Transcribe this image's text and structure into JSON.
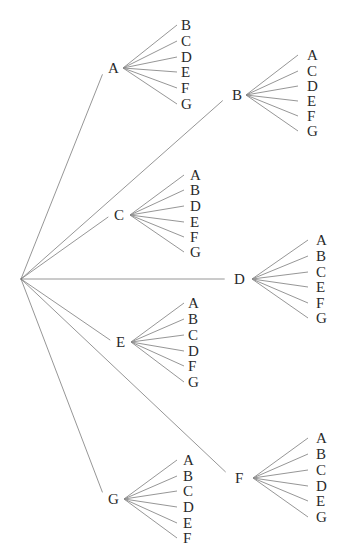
{
  "diagram": {
    "type": "tree",
    "clipped_header_text": "",
    "root": {
      "x": 21,
      "y": 279
    },
    "line_color": "#8a8a8a",
    "text_color": "#2a2a2a",
    "branches": [
      {
        "label": "A",
        "label_x": 108,
        "node_x": 123,
        "y": 68,
        "child_line_x": 177,
        "child_label_x": 181,
        "children": [
          {
            "label": "B",
            "y": 25
          },
          {
            "label": "C",
            "y": 41
          },
          {
            "label": "D",
            "y": 57
          },
          {
            "label": "E",
            "y": 72
          },
          {
            "label": "F",
            "y": 88
          },
          {
            "label": "G",
            "y": 104
          }
        ]
      },
      {
        "label": "B",
        "label_x": 232,
        "node_x": 246,
        "y": 95,
        "child_line_x": 298,
        "child_label_x": 307,
        "children": [
          {
            "label": "A",
            "y": 55
          },
          {
            "label": "C",
            "y": 71
          },
          {
            "label": "D",
            "y": 86
          },
          {
            "label": "E",
            "y": 101
          },
          {
            "label": "F",
            "y": 116
          },
          {
            "label": "G",
            "y": 131
          }
        ]
      },
      {
        "label": "C",
        "label_x": 114,
        "node_x": 130,
        "y": 215,
        "child_line_x": 184,
        "child_label_x": 190,
        "children": [
          {
            "label": "A",
            "y": 175
          },
          {
            "label": "B",
            "y": 190
          },
          {
            "label": "D",
            "y": 206
          },
          {
            "label": "E",
            "y": 222
          },
          {
            "label": "F",
            "y": 237
          },
          {
            "label": "G",
            "y": 252
          }
        ]
      },
      {
        "label": "D",
        "label_x": 234,
        "node_x": 252,
        "y": 279,
        "child_line_x": 308,
        "child_label_x": 316,
        "children": [
          {
            "label": "A",
            "y": 240
          },
          {
            "label": "B",
            "y": 256
          },
          {
            "label": "C",
            "y": 272
          },
          {
            "label": "E",
            "y": 287
          },
          {
            "label": "F",
            "y": 303
          },
          {
            "label": "G",
            "y": 318
          }
        ]
      },
      {
        "label": "E",
        "label_x": 116,
        "node_x": 131,
        "y": 342,
        "child_line_x": 184,
        "child_label_x": 188,
        "children": [
          {
            "label": "A",
            "y": 303
          },
          {
            "label": "B",
            "y": 319
          },
          {
            "label": "C",
            "y": 335
          },
          {
            "label": "D",
            "y": 351
          },
          {
            "label": "F",
            "y": 366
          },
          {
            "label": "G",
            "y": 382
          }
        ]
      },
      {
        "label": "F",
        "label_x": 235,
        "node_x": 253,
        "y": 478,
        "child_line_x": 308,
        "child_label_x": 316,
        "children": [
          {
            "label": "A",
            "y": 438
          },
          {
            "label": "B",
            "y": 454
          },
          {
            "label": "C",
            "y": 470
          },
          {
            "label": "D",
            "y": 486
          },
          {
            "label": "E",
            "y": 501
          },
          {
            "label": "G",
            "y": 517
          }
        ]
      },
      {
        "label": "G",
        "label_x": 108,
        "node_x": 124,
        "y": 499,
        "child_line_x": 177,
        "child_label_x": 183,
        "children": [
          {
            "label": "A",
            "y": 460
          },
          {
            "label": "B",
            "y": 476
          },
          {
            "label": "C",
            "y": 491
          },
          {
            "label": "D",
            "y": 507
          },
          {
            "label": "E",
            "y": 523
          },
          {
            "label": "F",
            "y": 538
          }
        ]
      }
    ]
  }
}
